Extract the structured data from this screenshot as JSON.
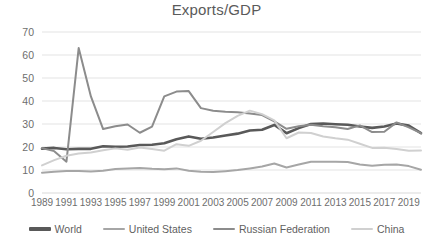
{
  "chart_data": {
    "type": "line",
    "title": "Exports/GDP",
    "xlabel": "",
    "ylabel": "",
    "ylim": [
      0,
      70
    ],
    "ytick_step": 10,
    "yticks": [
      0,
      10,
      20,
      30,
      40,
      50,
      60,
      70
    ],
    "grid": true,
    "legend_position": "bottom",
    "x": [
      1989,
      1990,
      1991,
      1992,
      1993,
      1994,
      1995,
      1996,
      1997,
      1998,
      1999,
      2000,
      2001,
      2002,
      2003,
      2004,
      2005,
      2006,
      2007,
      2008,
      2009,
      2010,
      2011,
      2012,
      2013,
      2014,
      2015,
      2016,
      2017,
      2018,
      2019,
      2020
    ],
    "xtick_labels": [
      "1989",
      "1991",
      "1993",
      "1995",
      "1997",
      "1999",
      "2001",
      "2003",
      "2005",
      "2007",
      "2009",
      "2011",
      "2013",
      "2015",
      "2017",
      "2019"
    ],
    "series": [
      {
        "name": "World",
        "color": "#595959",
        "width": 2.6,
        "values": [
          19.3,
          19.6,
          19.0,
          19.2,
          19.2,
          20.3,
          20.1,
          20.2,
          20.9,
          21.0,
          21.6,
          23.4,
          24.6,
          23.6,
          24.1,
          25.0,
          25.8,
          27.2,
          27.5,
          29.6,
          26.0,
          28.2,
          30.0,
          30.2,
          29.9,
          29.7,
          28.9,
          28.3,
          28.9,
          30.2,
          29.3,
          26.0
        ]
      },
      {
        "name": "United States",
        "color": "#a6a6a6",
        "width": 2.0,
        "values": [
          8.8,
          9.2,
          9.6,
          9.6,
          9.4,
          9.7,
          10.4,
          10.6,
          10.9,
          10.5,
          10.3,
          10.7,
          9.7,
          9.2,
          9.1,
          9.5,
          10.0,
          10.7,
          11.5,
          12.8,
          11.1,
          12.4,
          13.6,
          13.6,
          13.6,
          13.5,
          12.4,
          11.9,
          12.3,
          12.4,
          11.7,
          10.1
        ]
      },
      {
        "name": "Russian Federation",
        "color": "#8c8c8c",
        "width": 2.0,
        "values": [
          19.5,
          18.2,
          13.6,
          63.0,
          42.0,
          27.8,
          29.0,
          29.8,
          26.2,
          28.9,
          42.0,
          44.1,
          44.3,
          36.9,
          35.8,
          35.3,
          35.1,
          34.6,
          33.9,
          31.1,
          27.9,
          29.0,
          29.7,
          29.0,
          28.6,
          27.8,
          29.4,
          26.5,
          26.6,
          30.7,
          28.5,
          26.0
        ]
      },
      {
        "name": "China",
        "color": "#d0d0d0",
        "width": 2.0,
        "values": [
          12.0,
          14.3,
          16.2,
          17.2,
          17.6,
          18.6,
          19.4,
          18.8,
          19.8,
          19.1,
          18.4,
          21.2,
          20.5,
          22.7,
          26.5,
          30.4,
          33.5,
          35.8,
          34.3,
          31.6,
          23.8,
          26.3,
          26.1,
          24.6,
          23.8,
          23.2,
          21.4,
          19.6,
          19.7,
          19.1,
          18.4,
          18.5
        ]
      }
    ]
  },
  "legend": {
    "items": [
      {
        "label": "World",
        "color": "#595959"
      },
      {
        "label": "United States",
        "color": "#a6a6a6"
      },
      {
        "label": "Russian Federation",
        "color": "#8c8c8c"
      },
      {
        "label": "China",
        "color": "#d0d0d0"
      }
    ]
  }
}
